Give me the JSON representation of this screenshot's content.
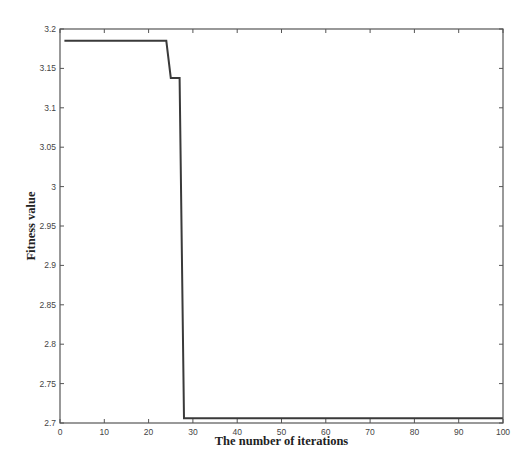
{
  "chart_data": {
    "type": "line",
    "title": "",
    "xlabel": "The number of iterations",
    "ylabel": "Fitness value",
    "xlim": [
      0,
      100
    ],
    "ylim": [
      2.7,
      3.2
    ],
    "xticks": [
      0,
      10,
      20,
      30,
      40,
      50,
      60,
      70,
      80,
      90,
      100
    ],
    "yticks": [
      2.7,
      2.75,
      2.8,
      2.85,
      2.9,
      2.95,
      3,
      3.05,
      3.1,
      3.15,
      3.2
    ],
    "xtick_labels": [
      "0",
      "10",
      "20",
      "30",
      "40",
      "50",
      "60",
      "70",
      "80",
      "90",
      "100"
    ],
    "ytick_labels": [
      "2.7",
      "2.75",
      "2.8",
      "2.85",
      "2.9",
      "2.95",
      "3",
      "3.05",
      "3.1",
      "3.15",
      "3.2"
    ],
    "grid": false,
    "legend": null,
    "series": [
      {
        "name": "fitness",
        "color": "#3a3a3a",
        "x": [
          1,
          24,
          25,
          27,
          28,
          100
        ],
        "y": [
          3.185,
          3.185,
          3.138,
          3.138,
          2.706,
          2.706
        ]
      }
    ]
  }
}
